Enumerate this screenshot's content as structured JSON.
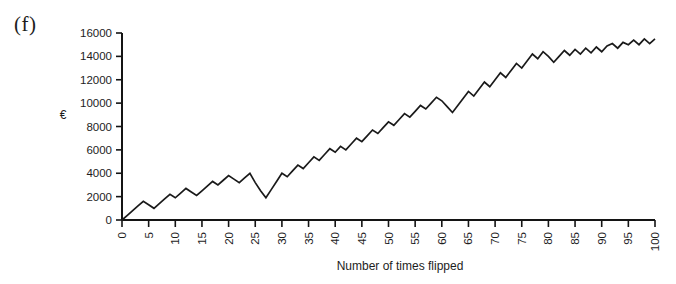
{
  "figure": {
    "panel_label": "(f)"
  },
  "chart_data": {
    "type": "line",
    "title": "",
    "subtitle": "",
    "xlabel": "Number of times flipped",
    "ylabel": "€",
    "xlim": [
      0,
      100
    ],
    "ylim": [
      0,
      16000
    ],
    "grid": false,
    "legend": null,
    "legend_position": "none",
    "xtick_labels": [
      "0",
      "5",
      "10",
      "15",
      "20",
      "25",
      "30",
      "35",
      "40",
      "45",
      "50",
      "55",
      "60",
      "65",
      "70",
      "75",
      "80",
      "85",
      "90",
      "95",
      "100"
    ],
    "xtick_values": [
      0,
      5,
      10,
      15,
      20,
      25,
      30,
      35,
      40,
      45,
      50,
      55,
      60,
      65,
      70,
      75,
      80,
      85,
      90,
      95,
      100
    ],
    "xtick_rotation": 90,
    "ytick_labels": [
      "0",
      "2000",
      "4000",
      "6000",
      "8000",
      "10000",
      "12000",
      "14000",
      "16000"
    ],
    "ytick_values": [
      0,
      2000,
      4000,
      6000,
      8000,
      10000,
      12000,
      14000,
      16000
    ],
    "series": [
      {
        "name": "Cumulative winnings",
        "color": "#1a1a1a",
        "x": [
          0,
          1,
          2,
          3,
          4,
          5,
          6,
          7,
          8,
          9,
          10,
          11,
          12,
          13,
          14,
          15,
          16,
          17,
          18,
          19,
          20,
          21,
          22,
          23,
          24,
          25,
          26,
          27,
          28,
          29,
          30,
          31,
          32,
          33,
          34,
          35,
          36,
          37,
          38,
          39,
          40,
          41,
          42,
          43,
          44,
          45,
          46,
          47,
          48,
          49,
          50,
          51,
          52,
          53,
          54,
          55,
          56,
          57,
          58,
          59,
          60,
          61,
          62,
          63,
          64,
          65,
          66,
          67,
          68,
          69,
          70,
          71,
          72,
          73,
          74,
          75,
          76,
          77,
          78,
          79,
          80,
          81,
          82,
          83,
          84,
          85,
          86,
          87,
          88,
          89,
          90,
          91,
          92,
          93,
          94,
          95,
          96,
          97,
          98,
          99,
          100
        ],
        "values": [
          0,
          400,
          800,
          1200,
          1600,
          1300,
          1000,
          1400,
          1800,
          2200,
          1900,
          2300,
          2700,
          2400,
          2100,
          2500,
          2900,
          3300,
          3000,
          3400,
          3800,
          3500,
          3200,
          3600,
          4000,
          3200,
          2500,
          1900,
          2600,
          3300,
          4000,
          3700,
          4200,
          4700,
          4400,
          4900,
          5400,
          5100,
          5600,
          6100,
          5800,
          6300,
          6000,
          6500,
          7000,
          6700,
          7200,
          7700,
          7400,
          7900,
          8400,
          8100,
          8600,
          9100,
          8800,
          9300,
          9800,
          9500,
          10000,
          10500,
          10200,
          9700,
          9200,
          9800,
          10400,
          11000,
          10600,
          11200,
          11800,
          11400,
          12000,
          12600,
          12200,
          12800,
          13400,
          13000,
          13600,
          14200,
          13800,
          14400,
          14000,
          13500,
          14000,
          14500,
          14100,
          14600,
          14200,
          14700,
          14300,
          14800,
          14400,
          14900,
          15100,
          14700,
          15200,
          15000,
          15400,
          15000,
          15500,
          15100,
          15500
        ]
      }
    ]
  }
}
